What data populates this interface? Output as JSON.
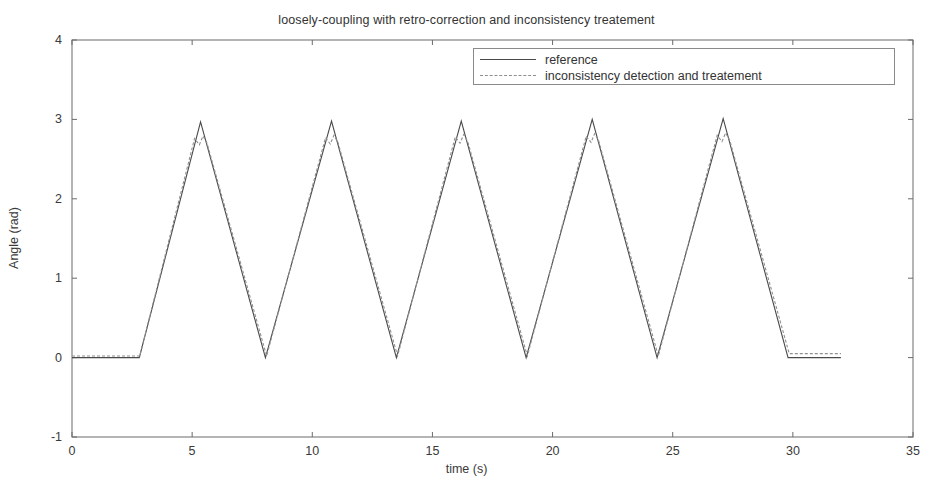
{
  "chart_data": {
    "type": "line",
    "title": "loosely-coupling with retro-correction and inconsistency treatement",
    "xlabel": "time (s)",
    "ylabel": "Angle (rad)",
    "xlim": [
      0,
      35
    ],
    "ylim": [
      -1,
      4
    ],
    "xticks": [
      0,
      5,
      10,
      15,
      20,
      25,
      30,
      35
    ],
    "yticks": [
      -1,
      0,
      1,
      2,
      3,
      4
    ],
    "grid": false,
    "legend_position": "top-right",
    "series": [
      {
        "name": "reference",
        "style": "solid",
        "color": "#4a4a4a",
        "x": [
          0,
          2.8,
          5.35,
          8.05,
          10.8,
          13.5,
          16.2,
          18.9,
          21.65,
          24.35,
          27.1,
          29.8,
          32.0
        ],
        "y": [
          0,
          0,
          2.97,
          0.0,
          2.98,
          0.0,
          2.98,
          0.0,
          3.0,
          0.0,
          3.01,
          0.0,
          0.0
        ]
      },
      {
        "name": "inconsistency detection and treatement",
        "style": "dashed",
        "color": "#909090",
        "x": [
          0,
          2.82,
          5.1,
          5.3,
          5.45,
          5.62,
          8.1,
          10.55,
          10.75,
          10.9,
          11.07,
          13.55,
          15.95,
          16.15,
          16.3,
          16.47,
          18.95,
          21.4,
          21.6,
          21.75,
          21.92,
          24.4,
          26.85,
          27.05,
          27.2,
          27.37,
          29.85,
          32.0
        ],
        "y": [
          0.02,
          0.02,
          2.76,
          2.68,
          2.79,
          2.7,
          0.02,
          2.77,
          2.69,
          2.8,
          2.71,
          0.02,
          2.78,
          2.7,
          2.81,
          2.72,
          0.02,
          2.79,
          2.71,
          2.82,
          2.73,
          0.02,
          2.8,
          2.72,
          2.83,
          2.74,
          0.05,
          0.05
        ]
      }
    ],
    "annotations": []
  },
  "legend": {
    "entries": [
      {
        "label": "reference",
        "style": "solid"
      },
      {
        "label": "inconsistency detection and treatement",
        "style": "dashed"
      }
    ]
  },
  "axis": {
    "x_tick_labels": [
      "0",
      "5",
      "10",
      "15",
      "20",
      "25",
      "30",
      "35"
    ],
    "y_tick_labels": [
      "-1",
      "0",
      "1",
      "2",
      "3",
      "4"
    ]
  }
}
